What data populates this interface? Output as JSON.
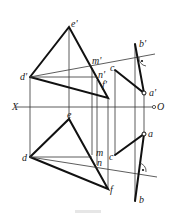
{
  "diagram": {
    "type": "descriptive-geometry-projection",
    "axis": {
      "left_label": "X",
      "right_label": "O"
    },
    "labels": {
      "e_prime": "e'",
      "d_prime": "d'",
      "m_prime": "m'",
      "n_prime": "n'",
      "f_prime": "f'",
      "c_prime": "c",
      "a_prime": "a'",
      "b_prime": "b'",
      "e": "e",
      "d": "d",
      "m": "m",
      "n": "n",
      "f": "f",
      "c": "c",
      "a": "a",
      "b": "b"
    },
    "colors": {
      "line": "#111111",
      "thin_line": "#333333",
      "background": "#ffffff"
    }
  }
}
